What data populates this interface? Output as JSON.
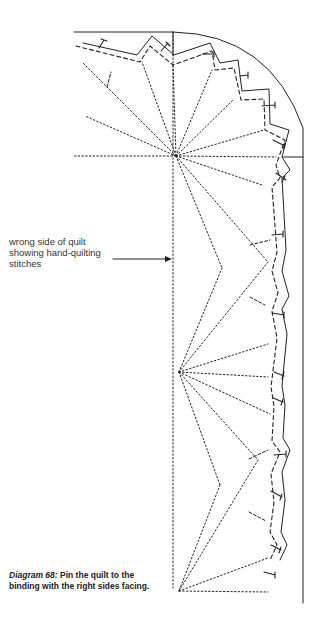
{
  "diagram": {
    "label": {
      "line1": "wrong side of quilt",
      "line2": "showing hand-quilting",
      "line3": "stitches"
    },
    "caption": {
      "lead": "Diagram 68:",
      "line1_rest": " Pin the quilt to the",
      "line2": "binding with the right sides facing."
    },
    "colors": {
      "ink": "#222222",
      "background": "#ffffff"
    }
  }
}
